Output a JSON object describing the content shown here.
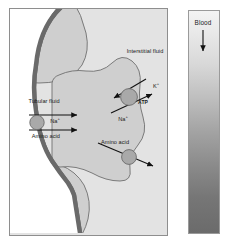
{
  "figure": {
    "type": "biological-schematic"
  },
  "panel": {
    "background_color": "#e3e3e3",
    "border_color": "#8e8e8e",
    "cell_fill_color": "#cfcfcf",
    "cell_outline_color": "#6f6f6f",
    "brush_border_color": "#6a6a6a",
    "lumen_fill_color": "#ffffff",
    "transporter_fill_color": "#a9a9a9",
    "transporter_outline_color": "#6b6b6b",
    "arrow_color": "#111111"
  },
  "labels": {
    "tubular_fluid": "Tubular fluid",
    "interstitial_fluid": "Interstitial fluid",
    "sodium_apical": "Na",
    "sodium_apical_charge": "+",
    "amino_acid_apical": "Amino acid",
    "amino_acid_cell": "Amino acid",
    "sodium_basolateral": "Na",
    "sodium_basolateral_charge": "+",
    "potassium_basolateral": "K",
    "potassium_basolateral_charge": "+",
    "atp_pump": "ATP"
  },
  "blood": {
    "label": "Blood",
    "arrow_direction": "down",
    "gradient_top_color": "#f3f3f3",
    "gradient_bottom_color": "#6b6b6b",
    "border_color": "#9a9a9a"
  }
}
